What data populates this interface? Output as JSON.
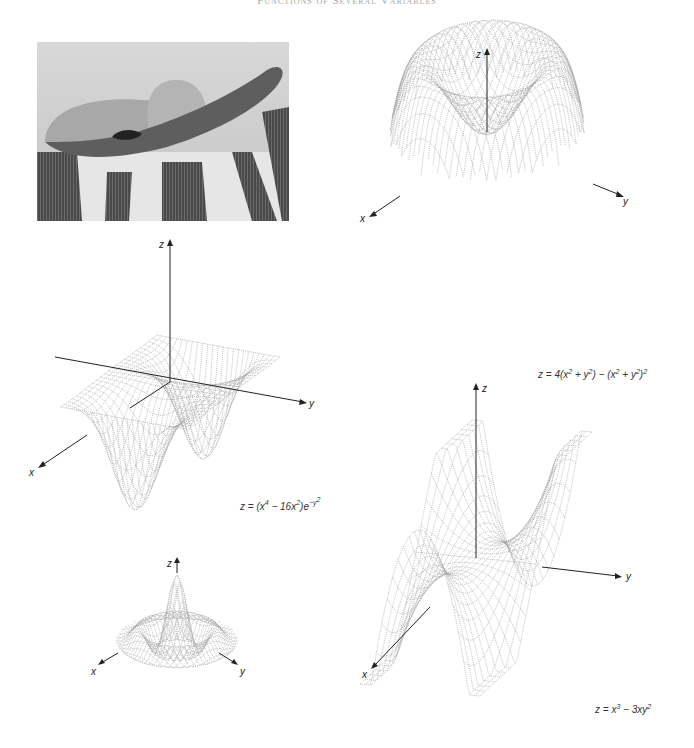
{
  "page": {
    "running_head": "Functions of Several Variables"
  },
  "photo": {
    "subject": "sombrero hat on striped blanket"
  },
  "figures": [
    {
      "id": "fig-quartic-bowl",
      "caption_html": "z = 4(x<sup>2</sup> + y<sup>2</sup>) − (x<sup>2</sup> + y<sup>2</sup>)<sup>2</sup>",
      "caption_text": "z = 4(x^2 + y^2) - (x^2 + y^2)^2",
      "function": "radial_quartic",
      "axes": {
        "x": "x",
        "y": "y",
        "z": "z"
      }
    },
    {
      "id": "fig-gaussian-saddle",
      "caption_html": "z = (x<sup>4</sup> − 16x<sup>2</sup>)e<sup>−y<sup>2</sup></sup>",
      "caption_text": "z = (x^4 - 16x^2)e^(-y^2)",
      "function": "quartic_gauss",
      "axes": {
        "x": "x",
        "y": "y",
        "z": "z"
      }
    },
    {
      "id": "fig-sombrero",
      "caption_html": "",
      "caption_text": "",
      "function": "sombrero",
      "axes": {
        "x": "x",
        "y": "y",
        "z": "z"
      }
    },
    {
      "id": "fig-monkey-saddle",
      "caption_html": "z = x<sup>3</sup> − 3xy<sup>2</sup>",
      "caption_text": "z = x^3 - 3xy^2",
      "function": "monkey_saddle",
      "axes": {
        "x": "x",
        "y": "y",
        "z": "z"
      }
    }
  ],
  "colors": {
    "mesh": "#9a9a9a",
    "axis": "#222222"
  }
}
